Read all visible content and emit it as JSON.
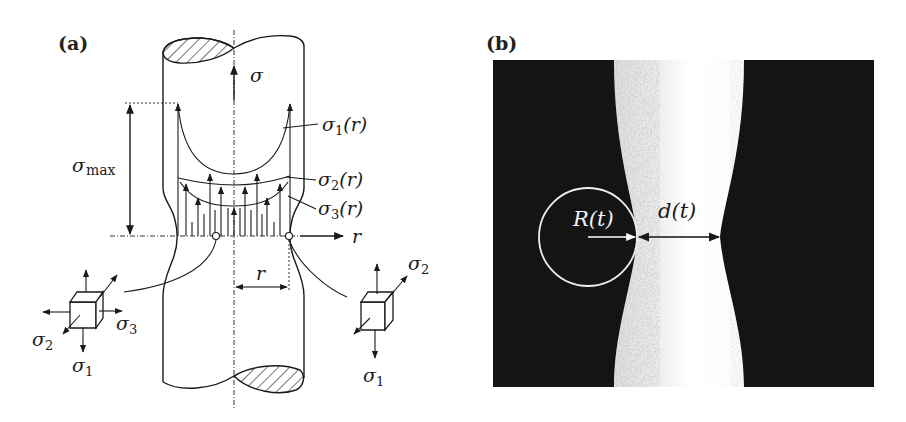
{
  "figure": {
    "panel_a": {
      "label": "(a)",
      "labels": {
        "sigma": "σ",
        "sigma_max": "σ",
        "sigma_max_sub": "max",
        "sigma1_r": "σ",
        "sigma1_r_sub": "1",
        "sigma1_r_arg": "(r)",
        "sigma2_r": "σ",
        "sigma2_r_sub": "2",
        "sigma2_r_arg": "(r)",
        "sigma3_r": "σ",
        "sigma3_r_sub": "3",
        "sigma3_r_arg": "(r)",
        "r_axis": "r",
        "r_dim": "r"
      },
      "left_element": {
        "sigma": "σ",
        "sigma2_sub": "2",
        "sigma3_sub": "3",
        "sigma1_sub": "1"
      },
      "right_element": {
        "sigma": "σ",
        "sigma2_sub": "2",
        "sigma1_sub": "1"
      }
    },
    "panel_b": {
      "label": "(b)",
      "radius_label": "R(t)",
      "distance_label": "d(t)"
    }
  }
}
